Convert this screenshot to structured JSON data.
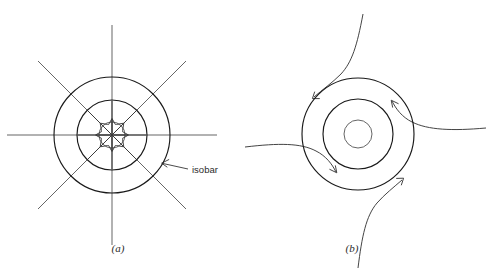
{
  "figure": {
    "background_color": "#ffffff",
    "stroke_color": "#1a1a1a",
    "width": 489,
    "height": 270
  },
  "panels": [
    {
      "id": "panel-a",
      "label": "(a)",
      "label_x": 118,
      "label_y": 252,
      "center_x": 112,
      "center_y": 135,
      "circles": [
        {
          "name": "outer-isobar",
          "radius": 58,
          "style": "heavy"
        },
        {
          "name": "middle-isobar",
          "radius": 35,
          "style": "heavy"
        },
        {
          "name": "core-circle",
          "radius": 13,
          "style": "light"
        }
      ],
      "radial_line_count": 8,
      "radial_inner_radius": 13,
      "radial_outer_radius": 105,
      "arrow_count": 8,
      "arrow_tail_radius": 34,
      "arrow_head_radius": 16,
      "arrow_direction": "inward",
      "annotation": {
        "text": "isobar",
        "text_x": 192,
        "text_y": 173,
        "leader_from_x": 188,
        "leader_from_y": 169,
        "leader_to_x": 161,
        "leader_to_y": 163
      }
    },
    {
      "id": "panel-b",
      "label": "(b)",
      "label_x": 352,
      "label_y": 252,
      "center_x": 358,
      "center_y": 134,
      "circles": [
        {
          "name": "outer-isobar",
          "radius": 56,
          "style": "heavy"
        },
        {
          "name": "middle-isobar",
          "radius": 35,
          "style": "heavy"
        },
        {
          "name": "core-circle",
          "radius": 14,
          "style": "light"
        }
      ],
      "spiral_count": 4,
      "spiral_direction": "counterclockwise-inward",
      "spirals": [
        {
          "name": "spiral-from-top",
          "entry": "top"
        },
        {
          "name": "spiral-from-right",
          "entry": "right"
        },
        {
          "name": "spiral-from-bottom",
          "entry": "bottom"
        },
        {
          "name": "spiral-from-left",
          "entry": "left"
        }
      ]
    }
  ]
}
